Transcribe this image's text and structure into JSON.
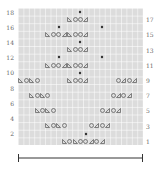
{
  "chart": {
    "columns": 23,
    "rows": 18,
    "grid_color": "#dcdcdc",
    "symbol_color": "#555555",
    "left_labels": [
      "18",
      "16",
      "14",
      "12",
      "10",
      "8",
      "6",
      "4",
      "2"
    ],
    "right_labels": [
      "17",
      "15",
      "13",
      "11",
      "9",
      "7",
      "5",
      "3",
      "1"
    ],
    "legend": {
      "lt": "ssk (left-leaning decrease)",
      "o": "yarn over",
      "rt": "k2tog (right-leaning decrease)",
      "star": "bobble / central stitch"
    },
    "symbols": [
      {
        "row": 18,
        "col": 12,
        "s": "star"
      },
      {
        "row": 17,
        "col": 10,
        "s": "lt"
      },
      {
        "row": 17,
        "col": 11,
        "s": "o"
      },
      {
        "row": 17,
        "col": 12,
        "s": "o"
      },
      {
        "row": 17,
        "col": 13,
        "s": "rt"
      },
      {
        "row": 16,
        "col": 8,
        "s": "star"
      },
      {
        "row": 16,
        "col": 16,
        "s": "star"
      },
      {
        "row": 15,
        "col": 6,
        "s": "lt"
      },
      {
        "row": 15,
        "col": 7,
        "s": "o"
      },
      {
        "row": 15,
        "col": 8,
        "s": "o"
      },
      {
        "row": 15,
        "col": 9,
        "s": "rt"
      },
      {
        "row": 15,
        "col": 10,
        "s": "lt"
      },
      {
        "row": 15,
        "col": 11,
        "s": "o"
      },
      {
        "row": 15,
        "col": 12,
        "s": "o"
      },
      {
        "row": 15,
        "col": 13,
        "s": "rt"
      },
      {
        "row": 14,
        "col": 12,
        "s": "star"
      },
      {
        "row": 13,
        "col": 10,
        "s": "lt"
      },
      {
        "row": 13,
        "col": 11,
        "s": "o"
      },
      {
        "row": 13,
        "col": 12,
        "s": "o"
      },
      {
        "row": 13,
        "col": 13,
        "s": "rt"
      },
      {
        "row": 12,
        "col": 8,
        "s": "star"
      },
      {
        "row": 12,
        "col": 16,
        "s": "star"
      },
      {
        "row": 11,
        "col": 6,
        "s": "lt"
      },
      {
        "row": 11,
        "col": 7,
        "s": "o"
      },
      {
        "row": 11,
        "col": 8,
        "s": "o"
      },
      {
        "row": 11,
        "col": 9,
        "s": "rt"
      },
      {
        "row": 11,
        "col": 10,
        "s": "lt"
      },
      {
        "row": 11,
        "col": 11,
        "s": "o"
      },
      {
        "row": 11,
        "col": 12,
        "s": "o"
      },
      {
        "row": 11,
        "col": 13,
        "s": "rt"
      },
      {
        "row": 10,
        "col": 12,
        "s": "star"
      },
      {
        "row": 9,
        "col": 1,
        "s": "lt"
      },
      {
        "row": 9,
        "col": 2,
        "s": "o"
      },
      {
        "row": 9,
        "col": 3,
        "s": "lt"
      },
      {
        "row": 9,
        "col": 4,
        "s": "o"
      },
      {
        "row": 9,
        "col": 10,
        "s": "lt"
      },
      {
        "row": 9,
        "col": 11,
        "s": "o"
      },
      {
        "row": 9,
        "col": 12,
        "s": "o"
      },
      {
        "row": 9,
        "col": 13,
        "s": "rt"
      },
      {
        "row": 9,
        "col": 19,
        "s": "o"
      },
      {
        "row": 9,
        "col": 20,
        "s": "rt"
      },
      {
        "row": 9,
        "col": 21,
        "s": "o"
      },
      {
        "row": 9,
        "col": 22,
        "s": "rt"
      },
      {
        "row": 7,
        "col": 3,
        "s": "lt"
      },
      {
        "row": 7,
        "col": 4,
        "s": "o"
      },
      {
        "row": 7,
        "col": 5,
        "s": "lt"
      },
      {
        "row": 7,
        "col": 6,
        "s": "o"
      },
      {
        "row": 7,
        "col": 18,
        "s": "o"
      },
      {
        "row": 7,
        "col": 19,
        "s": "rt"
      },
      {
        "row": 7,
        "col": 20,
        "s": "o"
      },
      {
        "row": 7,
        "col": 21,
        "s": "rt"
      },
      {
        "row": 5,
        "col": 4,
        "s": "lt"
      },
      {
        "row": 5,
        "col": 5,
        "s": "o"
      },
      {
        "row": 5,
        "col": 6,
        "s": "lt"
      },
      {
        "row": 5,
        "col": 7,
        "s": "o"
      },
      {
        "row": 5,
        "col": 16,
        "s": "o"
      },
      {
        "row": 5,
        "col": 17,
        "s": "rt"
      },
      {
        "row": 5,
        "col": 18,
        "s": "o"
      },
      {
        "row": 5,
        "col": 19,
        "s": "rt"
      },
      {
        "row": 3,
        "col": 6,
        "s": "lt"
      },
      {
        "row": 3,
        "col": 7,
        "s": "o"
      },
      {
        "row": 3,
        "col": 8,
        "s": "lt"
      },
      {
        "row": 3,
        "col": 9,
        "s": "o"
      },
      {
        "row": 3,
        "col": 14,
        "s": "o"
      },
      {
        "row": 3,
        "col": 15,
        "s": "rt"
      },
      {
        "row": 3,
        "col": 16,
        "s": "o"
      },
      {
        "row": 3,
        "col": 17,
        "s": "rt"
      },
      {
        "row": 2,
        "col": 13,
        "s": "star"
      },
      {
        "row": 1,
        "col": 9,
        "s": "lt"
      },
      {
        "row": 1,
        "col": 10,
        "s": "o"
      },
      {
        "row": 1,
        "col": 11,
        "s": "lt"
      },
      {
        "row": 1,
        "col": 12,
        "s": "o"
      },
      {
        "row": 1,
        "col": 13,
        "s": "o"
      },
      {
        "row": 1,
        "col": 14,
        "s": "rt"
      },
      {
        "row": 1,
        "col": 15,
        "s": "o"
      },
      {
        "row": 1,
        "col": 16,
        "s": "rt"
      }
    ],
    "scale_bar": {
      "label": ""
    }
  }
}
